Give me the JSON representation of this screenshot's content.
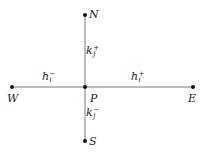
{
  "diagram": {
    "type": "five-point stencil",
    "nodes": [
      {
        "id": "N",
        "label": "N",
        "x": 85,
        "y": 15
      },
      {
        "id": "W",
        "label": "W",
        "x": 12,
        "y": 87
      },
      {
        "id": "P",
        "label": "P",
        "x": 85,
        "y": 87
      },
      {
        "id": "E",
        "label": "E",
        "x": 193,
        "y": 87
      },
      {
        "id": "S",
        "label": "S",
        "x": 85,
        "y": 141
      }
    ],
    "edges": [
      {
        "from": "P",
        "to": "N",
        "label_base": "k",
        "label_sub": "j",
        "label_sup": "+"
      },
      {
        "from": "P",
        "to": "S",
        "label_base": "k",
        "label_sub": "j",
        "label_sup": "−"
      },
      {
        "from": "W",
        "to": "P",
        "label_base": "h",
        "label_sub": "i",
        "label_sup": "−"
      },
      {
        "from": "P",
        "to": "E",
        "label_base": "h",
        "label_sub": "i",
        "label_sup": "+"
      }
    ],
    "colors": {
      "line": "#777777",
      "dot": "#111111",
      "text": "#222222"
    }
  }
}
